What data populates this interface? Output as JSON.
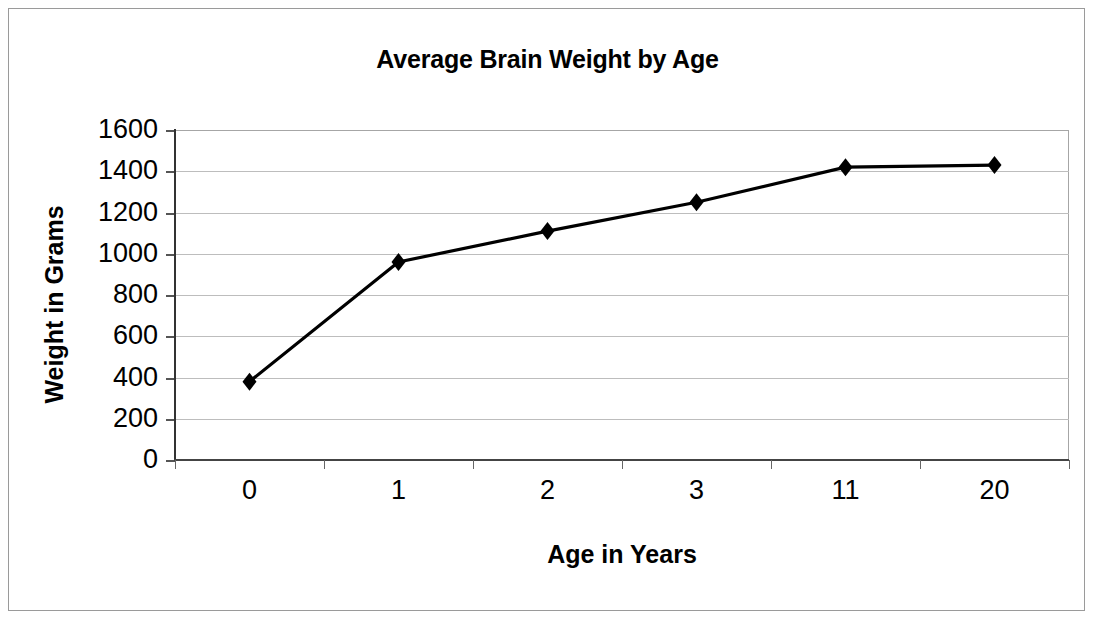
{
  "chart_data": {
    "type": "line",
    "title": "Average Brain Weight by Age",
    "xlabel": "Age in Years",
    "ylabel": "Weight in Grams",
    "categories": [
      "0",
      "1",
      "2",
      "3",
      "11",
      "20"
    ],
    "values": [
      380,
      960,
      1110,
      1250,
      1420,
      1430
    ],
    "series": [
      {
        "name": "Average Brain Weight",
        "values": [
          380,
          960,
          1110,
          1250,
          1420,
          1430
        ]
      }
    ],
    "ylim": [
      0,
      1600
    ],
    "ytick_step": 200,
    "yticks": [
      1600,
      1400,
      1200,
      1000,
      800,
      600,
      400,
      200,
      0
    ],
    "grid": true,
    "grid_axis": "y",
    "legend": false,
    "marker": "diamond",
    "line_color": "#000000",
    "marker_color": "#000000",
    "gridline_color": "#bdbdbd",
    "axis_color": "#333333",
    "background_color": "#ffffff",
    "border_color": "#9a9a9a"
  }
}
